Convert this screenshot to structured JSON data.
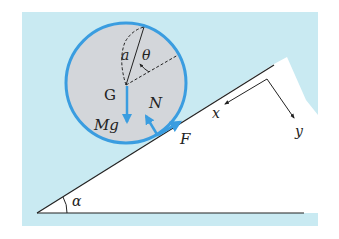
{
  "figure": {
    "type": "free-body diagram",
    "colors": {
      "background_panel": "#c9eaf2",
      "incline_fill": "#ffffff",
      "cylinder_fill": "#d3d6da",
      "cylinder_stroke": "#3a9de0",
      "force_arrow": "#3a9de0",
      "lines": "#222222"
    }
  },
  "labels": {
    "radius": "a",
    "angle_theta": "θ",
    "center": "G",
    "weight": "Mg",
    "normal_force": "N",
    "friction": "F",
    "x_axis": "x",
    "y_axis": "y",
    "incline_angle": "α"
  }
}
